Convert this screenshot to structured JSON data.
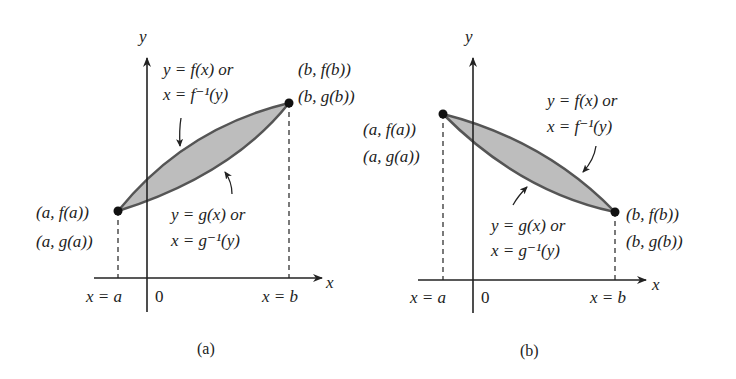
{
  "panel_a": {
    "caption": "(a)",
    "y_axis_label": "y",
    "x_axis_label": "x",
    "origin_label": "0",
    "x_a_label": "x = a",
    "x_b_label": "x = b",
    "upper_curve_line1": "y = f(x) or",
    "upper_curve_line2": "x = f⁻¹(y)",
    "lower_curve_line1": "y = g(x) or",
    "lower_curve_line2": "x = g⁻¹(y)",
    "point_a_line1": "(a, f(a))",
    "point_a_line2": "(a, g(a))",
    "point_b_line1": "(b, f(b))",
    "point_b_line2": "(b, g(b))"
  },
  "panel_b": {
    "caption": "(b)",
    "y_axis_label": "y",
    "x_axis_label": "x",
    "origin_label": "0",
    "x_a_label": "x = a",
    "x_b_label": "x = b",
    "upper_curve_line1": "y = f(x) or",
    "upper_curve_line2": "x = f⁻¹(y)",
    "lower_curve_line1": "y = g(x) or",
    "lower_curve_line2": "x = g⁻¹(y)",
    "point_a_line1": "(a, f(a))",
    "point_a_line2": "(a, g(a))",
    "point_b_line1": "(b, f(b))",
    "point_b_line2": "(b, g(b))"
  },
  "colors": {
    "region_fill": "#bdbdbd",
    "curve_stroke": "#555555",
    "axis": "#222222"
  }
}
